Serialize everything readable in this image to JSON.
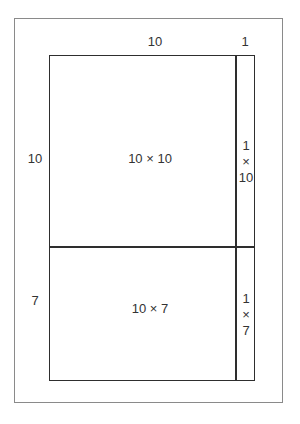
{
  "diagram": {
    "top_labels": {
      "width_a": "10",
      "width_b": "1"
    },
    "side_labels": {
      "height_a": "10",
      "height_b": "7"
    },
    "cells": {
      "top_left": "10 × 10",
      "top_right": [
        "1",
        "×",
        "10"
      ],
      "bottom_left": "10 × 7",
      "bottom_right": [
        "1",
        "×",
        "7"
      ]
    },
    "colors": {
      "outer_border": "#8a8a8a",
      "grid_lines": "#2e2e2e",
      "text": "#333333"
    }
  }
}
